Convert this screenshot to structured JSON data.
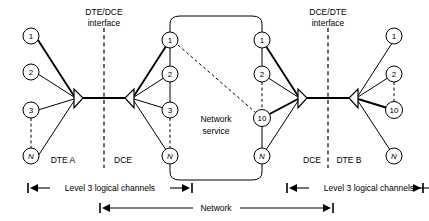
{
  "diagram": {
    "colors": {
      "ink": "#000000",
      "paper": "#ffffff"
    },
    "interfaces": [
      {
        "id": "left",
        "label_line1": "DTE/DCE",
        "label_line2": "interface"
      },
      {
        "id": "right",
        "label_line1": "DCE/DTE",
        "label_line2": "interface"
      }
    ],
    "network_service_label_line1": "Network",
    "network_service_label_line2": "service",
    "zone_labels": {
      "dte_a": "DTE A",
      "dce_left": "DCE",
      "dce_right": "DCE",
      "dte_b": "DTE B"
    },
    "measures": [
      {
        "id": "left-channels",
        "label": "Level 3 logical channels"
      },
      {
        "id": "right-channels",
        "label": "Level 3 logical channels"
      },
      {
        "id": "network-span",
        "label": "Network"
      }
    ],
    "node_groups": [
      {
        "id": "dte-a",
        "nodes": [
          {
            "id": "a1",
            "label": "1",
            "italic": false
          },
          {
            "id": "a2",
            "label": "2",
            "italic": false
          },
          {
            "id": "a3",
            "label": "3",
            "italic": false
          },
          {
            "id": "aN",
            "label": "N",
            "italic": true
          }
        ]
      },
      {
        "id": "dce-left",
        "nodes": [
          {
            "id": "b1",
            "label": "1",
            "italic": false
          },
          {
            "id": "b2",
            "label": "2",
            "italic": false
          },
          {
            "id": "b3",
            "label": "3",
            "italic": false
          },
          {
            "id": "bN",
            "label": "N",
            "italic": true
          }
        ]
      },
      {
        "id": "dce-right",
        "nodes": [
          {
            "id": "c1",
            "label": "1",
            "italic": false
          },
          {
            "id": "c2",
            "label": "2",
            "italic": false
          },
          {
            "id": "c10",
            "label": "10",
            "italic": false
          },
          {
            "id": "cN",
            "label": "N",
            "italic": true
          }
        ]
      },
      {
        "id": "dte-b",
        "nodes": [
          {
            "id": "d1",
            "label": "1",
            "italic": false
          },
          {
            "id": "d2",
            "label": "2",
            "italic": false
          },
          {
            "id": "d10",
            "label": "10",
            "italic": false
          },
          {
            "id": "dN",
            "label": "N",
            "italic": true
          }
        ]
      }
    ]
  }
}
